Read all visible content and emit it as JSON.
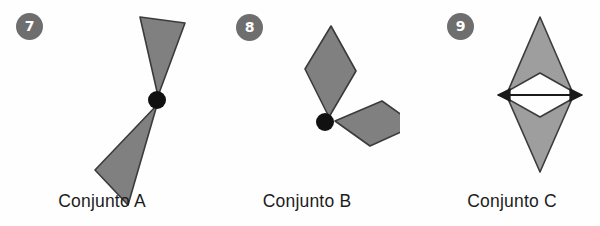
{
  "page": {
    "background_color": "#fefefe",
    "width": 600,
    "height": 226
  },
  "style": {
    "badge_fill": "#6e6e6e",
    "badge_text_color": "#ffffff",
    "shape_fill_dark": "#808080",
    "shape_fill_light": "#9e9e9e",
    "shape_stroke": "#3b3b3b",
    "pivot_dot_color": "#111111",
    "axis_line_color": "#1a1a1a",
    "caption_color": "#1c1c1c"
  },
  "panels": [
    {
      "id": "a",
      "badge": "7",
      "caption": "Conjunto A",
      "figure_name": "two-triangles-rotational-figure",
      "pivot": {
        "cx": 157,
        "cy": 100,
        "r": 9
      },
      "shapes": [
        {
          "name": "upper-triangle",
          "points": "140 17, 185 23, 158 96",
          "fill": "#808080"
        },
        {
          "name": "lower-triangle",
          "points": "95 170, 128 205, 157 105",
          "fill": "#808080"
        }
      ]
    },
    {
      "id": "b",
      "badge": "8",
      "caption": "Conjunto B",
      "figure_name": "two-rhombi-rotational-figure",
      "pivot": {
        "cx": 325,
        "cy": 122,
        "r": 9
      },
      "shapes": [
        {
          "name": "upper-rhombus",
          "points": "331 26, 356 71, 329 117, 305 69",
          "fill": "#808080"
        },
        {
          "name": "right-rhombus",
          "points": "335 121, 382 101, 416 125, 370 146",
          "fill": "#808080"
        }
      ]
    },
    {
      "id": "c",
      "badge": "9",
      "caption": "Conjunto C",
      "figure_name": "two-chevrons-reflection-figure",
      "axis": {
        "name": "horizontal-symmetry-axis-arrow",
        "x1": 496,
        "x2": 584,
        "y": 95
      },
      "shapes": [
        {
          "name": "upper-chevron",
          "points": "540 17, 572 91, 540 73, 508 91",
          "fill": "#9e9e9e"
        },
        {
          "name": "lower-chevron",
          "points": "540 172, 508 99, 540 117, 572 99",
          "fill": "#9e9e9e"
        }
      ]
    }
  ]
}
